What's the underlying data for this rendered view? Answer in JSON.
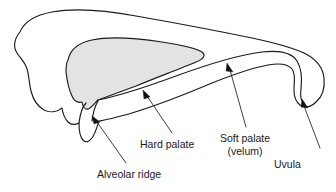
{
  "diagram": {
    "background_color": "#ffffff",
    "outline_color": "#1a1a1a",
    "shade_color": "#e3e3e3",
    "text_color": "#1a1a1a",
    "arrow_color": "#111111",
    "leader_color": "#2a2a2a"
  },
  "labels": {
    "alveolar_ridge": "Alveolar ridge",
    "hard_palate": "Hard palate",
    "soft_palate_line1": "Soft palate",
    "soft_palate_line2": "(velum)",
    "uvula": "Uvula"
  },
  "annotations": [
    {
      "name": "alveolar-ridge",
      "text": "Alveolar ridge",
      "arrow_tip": [
        92,
        116
      ],
      "leader_start": [
        126,
        163
      ],
      "label_anchor": [
        97,
        178
      ]
    },
    {
      "name": "hard-palate",
      "text": "Hard palate",
      "arrow_tip": [
        143,
        90
      ],
      "leader_start": [
        172,
        133
      ],
      "label_anchor": [
        140,
        148
      ]
    },
    {
      "name": "soft-palate",
      "text": "Soft palate (velum)",
      "arrow_tip": [
        227,
        63
      ],
      "leader_start": [
        246,
        127
      ],
      "label_anchor": [
        245,
        142
      ]
    },
    {
      "name": "uvula",
      "text": "Uvula",
      "arrow_tip": [
        302,
        99
      ],
      "leader_start": [
        320,
        148
      ],
      "label_anchor": [
        274,
        168
      ]
    }
  ]
}
